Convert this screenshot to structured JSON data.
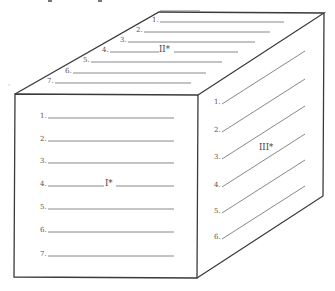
{
  "diagram": {
    "type": "cube-worksheet",
    "colors": {
      "edge": "#3a3a3a",
      "rule": "#6a6a6a",
      "text": "#555555",
      "background": "#ffffff"
    },
    "top_face": {
      "label": "II*",
      "rows": [
        "1.",
        "2.",
        "3.",
        "4.",
        "5.",
        "6.",
        "7."
      ]
    },
    "front_face": {
      "label": "I*",
      "rows": [
        "1.",
        "2.",
        "3.",
        "4.",
        "5.",
        "6.",
        "7."
      ]
    },
    "right_face": {
      "label": "III*",
      "rows": [
        "1.",
        "2.",
        "3.",
        "4.",
        "5.",
        "6."
      ]
    }
  }
}
